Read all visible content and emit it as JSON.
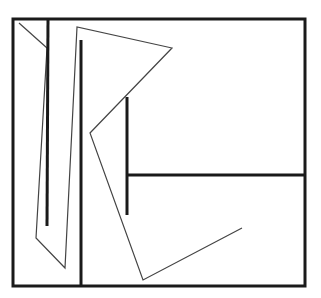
{
  "diagram": {
    "colors": {
      "background": "#ffffff",
      "thick_stroke": "#1a1a1a",
      "thin_stroke": "#444444"
    },
    "frame": {
      "x": 13,
      "y": 19,
      "width": 292,
      "height": 267,
      "stroke_width": 3
    },
    "thick_lines": [
      {
        "name": "left-vertical-bar",
        "x1": 48,
        "y1": 19,
        "x2": 47,
        "y2": 226,
        "width": 3
      },
      {
        "name": "divider-vertical-bar",
        "x1": 81,
        "y1": 40,
        "x2": 81,
        "y2": 286,
        "width": 3
      },
      {
        "name": "inner-vertical-bar",
        "x1": 127,
        "y1": 97,
        "x2": 127,
        "y2": 215,
        "width": 3
      },
      {
        "name": "horizontal-bar",
        "x1": 127,
        "y1": 175,
        "x2": 305,
        "y2": 175,
        "width": 3
      }
    ],
    "thin_paths": [
      {
        "name": "corner-diagonal",
        "points": "19,23 47,48"
      },
      {
        "name": "zigzag-polyline",
        "points": "47,48 36,238 65,268 77,27 172,48 90,133 143,280 242,228"
      }
    ]
  }
}
